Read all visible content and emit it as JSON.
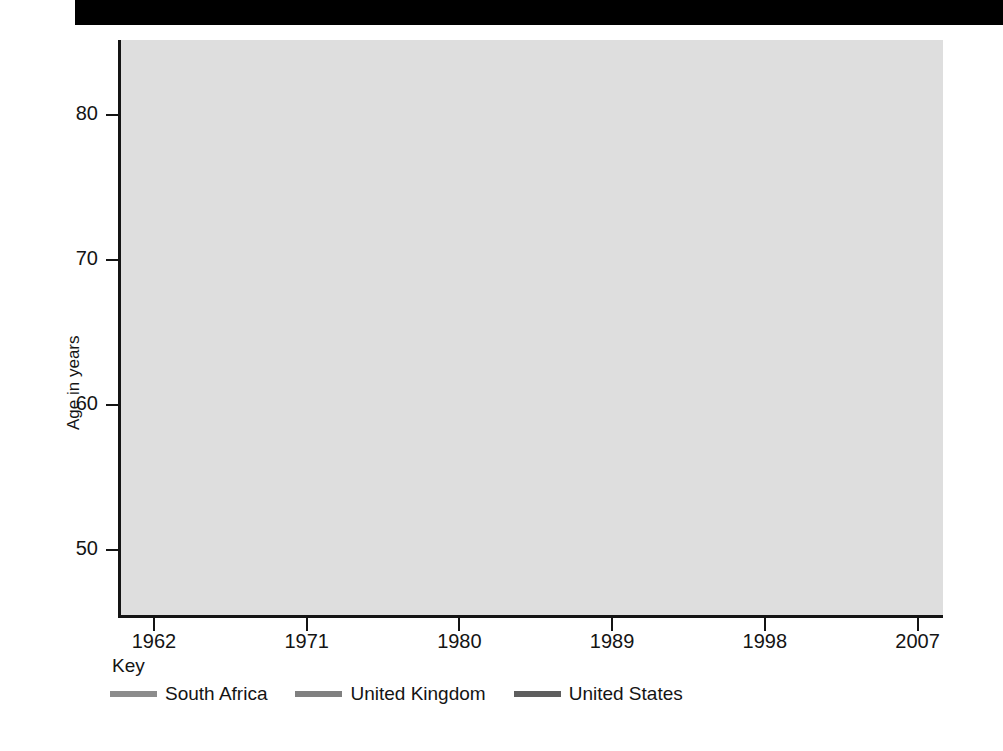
{
  "figure": {
    "background_color": "#ffffff",
    "plot_background_color": "#dedede",
    "gridline_color": "#ffffff",
    "axis_color": "#141414",
    "top_bar_color": "#000000"
  },
  "legend": {
    "title": "Key",
    "position": "below-axis",
    "items": [
      {
        "label": "South Africa",
        "color": "#8c8c8c"
      },
      {
        "label": "United Kingdom",
        "color": "#808080"
      },
      {
        "label": "United States",
        "color": "#5e5e5e"
      }
    ]
  },
  "chart_data": {
    "type": "line",
    "title": "",
    "subtitle": "",
    "xlabel": "",
    "ylabel": "Age in years",
    "xlim": [
      1960,
      2008.5
    ],
    "ylim": [
      45.5,
      85.2
    ],
    "xticks": [
      1962,
      1971,
      1980,
      1989,
      1998,
      2007
    ],
    "xtick_labels": [
      "1962",
      "1971",
      "1980",
      "1989",
      "1998",
      "2007"
    ],
    "yticks": [
      50,
      60,
      70,
      80
    ],
    "ytick_labels": [
      "50",
      "60",
      "70",
      "80"
    ],
    "grid": true,
    "grid_axis": "both",
    "legend_position": "bottom-left",
    "series": [
      {
        "name": "South Africa",
        "color": "#8c8c8c",
        "x": [
          1960,
          1962,
          1964,
          1966,
          1968,
          1970,
          1972,
          1974,
          1976,
          1978,
          1980,
          1982,
          1984,
          1986,
          1988,
          1990,
          1991,
          1992,
          1994,
          1996,
          1998,
          2000,
          2002,
          2004,
          2006,
          2007,
          2008
        ],
        "values": [
          48.9,
          49.6,
          50.3,
          51.0,
          51.7,
          52.4,
          53.1,
          53.8,
          54.5,
          55.3,
          56.2,
          57.3,
          58.5,
          59.7,
          60.7,
          61.2,
          61.3,
          61.2,
          60.6,
          59.4,
          57.6,
          55.4,
          53.3,
          51.9,
          51.2,
          51.1,
          51.1
        ]
      },
      {
        "name": "United Kingdom",
        "color": "#808080",
        "x": [
          1960,
          1961,
          1962,
          1963,
          1964,
          1965,
          1966,
          1967,
          1968,
          1969,
          1970,
          1971,
          1972,
          1973,
          1974,
          1975,
          1976,
          1977,
          1978,
          1979,
          1980,
          1981,
          1982,
          1983,
          1984,
          1985,
          1986,
          1987,
          1988,
          1989,
          1990,
          1991,
          1992,
          1993,
          1994,
          1995,
          1996,
          1997,
          1998,
          1999,
          2000,
          2001,
          2002,
          2003,
          2004,
          2005,
          2006,
          2007,
          2008
        ],
        "values": [
          71.1,
          71.0,
          70.8,
          70.9,
          71.4,
          71.4,
          71.5,
          71.8,
          71.5,
          71.5,
          71.8,
          71.9,
          72.0,
          72.1,
          72.4,
          72.8,
          72.8,
          73.3,
          73.2,
          73.6,
          73.9,
          74.2,
          74.2,
          74.3,
          74.6,
          74.6,
          74.9,
          75.1,
          75.1,
          75.3,
          75.9,
          76.0,
          76.4,
          76.3,
          76.8,
          76.8,
          77.0,
          77.2,
          77.2,
          77.4,
          77.8,
          78.0,
          78.2,
          78.4,
          78.8,
          79.1,
          79.4,
          79.6,
          79.7
        ]
      },
      {
        "name": "United States",
        "color": "#5e5e5e",
        "x": [
          1960,
          1961,
          1962,
          1963,
          1964,
          1965,
          1966,
          1967,
          1968,
          1969,
          1970,
          1971,
          1972,
          1973,
          1974,
          1975,
          1976,
          1977,
          1978,
          1979,
          1980,
          1981,
          1982,
          1983,
          1984,
          1985,
          1986,
          1987,
          1988,
          1989,
          1990,
          1991,
          1992,
          1993,
          1994,
          1995,
          1996,
          1997,
          1998,
          1999,
          2000,
          2001,
          2002,
          2003,
          2004,
          2005,
          2006,
          2007,
          2008
        ],
        "values": [
          69.8,
          70.2,
          70.1,
          70.0,
          70.2,
          70.2,
          70.2,
          70.5,
          70.2,
          70.5,
          70.8,
          71.1,
          71.2,
          71.4,
          72.0,
          72.6,
          72.9,
          73.3,
          73.3,
          73.9,
          73.7,
          74.1,
          74.5,
          74.6,
          74.7,
          74.7,
          74.7,
          74.9,
          74.9,
          75.1,
          75.4,
          75.5,
          75.8,
          75.5,
          75.7,
          75.8,
          76.1,
          76.5,
          76.7,
          76.7,
          76.8,
          76.9,
          77.0,
          77.1,
          77.5,
          77.6,
          77.8,
          78.1,
          78.2
        ]
      }
    ]
  }
}
